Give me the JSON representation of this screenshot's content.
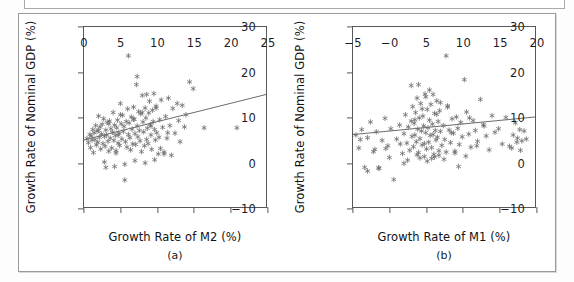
{
  "figure": {
    "panels": [
      {
        "id": "a",
        "caption": "(a)",
        "xlabel": "Growth Rate of M2 (%)",
        "ylabel": "Growth Rate of Nominal GDP (%)",
        "xticks": [
          "0",
          "5",
          "10",
          "15",
          "20",
          "25"
        ],
        "yticks": [
          "30",
          "20",
          "10",
          "0",
          "-10"
        ]
      },
      {
        "id": "b",
        "caption": "(b)",
        "xlabel": "Growth Rate of M1 (%)",
        "ylabel": "Growth Rate of Nominal GDP (%)",
        "xticks": [
          "-5",
          "-0",
          "5",
          "10",
          "15",
          "20"
        ],
        "yticks": [
          "30",
          "20",
          "10",
          "0",
          "-10"
        ]
      }
    ]
  },
  "style": {
    "marker_color": "#6e6e72",
    "line_color": "#5a5a5e",
    "axis_color": "#58585a",
    "frame_color": "#9a9a9c"
  },
  "chart_data": [
    {
      "type": "scatter",
      "id": "a",
      "title": "",
      "xlabel": "Growth Rate of M2 (%)",
      "ylabel": "Growth Rate of Nominal GDP (%)",
      "xlim": [
        0,
        25
      ],
      "ylim": [
        -10,
        30
      ],
      "xticks": [
        0,
        5,
        10,
        15,
        20,
        25
      ],
      "yticks": [
        -10,
        0,
        10,
        20,
        30
      ],
      "grid": false,
      "legend": "none",
      "marker": "asterisk",
      "trendline": {
        "x": [
          0,
          25
        ],
        "y": [
          4.9,
          15.0
        ]
      },
      "x": [
        0.4,
        0.6,
        0.8,
        0.9,
        1.0,
        1.1,
        1.2,
        1.3,
        1.4,
        1.5,
        1.6,
        1.7,
        1.8,
        1.9,
        2.0,
        2.1,
        2.2,
        2.3,
        2.4,
        2.5,
        2.6,
        2.7,
        2.8,
        2.9,
        3.0,
        3.1,
        3.2,
        3.3,
        3.4,
        3.5,
        3.6,
        3.7,
        3.8,
        3.9,
        4.0,
        4.1,
        4.2,
        4.3,
        4.4,
        4.5,
        4.6,
        4.7,
        4.8,
        4.9,
        5.0,
        5.1,
        5.2,
        5.3,
        5.4,
        5.5,
        5.6,
        5.7,
        5.8,
        5.9,
        6.0,
        6.1,
        6.2,
        6.3,
        6.4,
        6.5,
        6.6,
        6.7,
        6.8,
        6.9,
        7.0,
        7.1,
        7.2,
        7.3,
        7.4,
        7.5,
        7.6,
        7.7,
        7.8,
        7.9,
        8.0,
        8.1,
        8.2,
        8.3,
        8.4,
        8.5,
        8.6,
        8.7,
        8.8,
        8.9,
        9.0,
        9.1,
        9.2,
        9.3,
        9.4,
        9.5,
        9.6,
        9.7,
        9.8,
        9.9,
        10.0,
        10.2,
        10.4,
        10.5,
        10.6,
        10.8,
        11.0,
        11.2,
        11.4,
        11.6,
        11.8,
        12.0,
        12.2,
        12.5,
        12.8,
        13.0,
        13.2,
        13.5,
        13.8,
        14.0,
        14.5,
        15.0,
        16.5,
        21.0,
        6.1,
        7.3,
        8.6,
        9.9,
        5.0,
        2.0,
        3.4,
        4.7,
        6.8,
        8.0,
        9.2,
        10.3,
        11.5,
        2.8,
        4.2,
        5.6,
        7.0,
        8.4,
        9.7,
        11.0,
        3.0,
        4.4
      ],
      "y": [
        5.2,
        4.3,
        6.1,
        3.2,
        5.8,
        4.9,
        7.2,
        2.1,
        6.5,
        5.0,
        8.1,
        3.8,
        6.9,
        4.4,
        10.2,
        5.5,
        7.8,
        2.9,
        6.2,
        8.4,
        4.1,
        9.6,
        5.7,
        3.5,
        7.1,
        6.0,
        8.8,
        4.6,
        2.4,
        9.1,
        5.3,
        7.4,
        3.1,
        6.6,
        11.0,
        4.8,
        8.2,
        5.9,
        2.0,
        7.6,
        9.3,
        4.2,
        6.4,
        3.7,
        13.0,
        8.5,
        5.1,
        10.4,
        6.8,
        7.9,
        -4.0,
        4.5,
        9.0,
        3.3,
        11.8,
        6.1,
        8.7,
        5.4,
        2.7,
        10.0,
        7.3,
        4.0,
        12.2,
        9.5,
        6.3,
        3.9,
        17.2,
        8.0,
        5.6,
        11.2,
        7.0,
        4.7,
        10.7,
        2.3,
        14.8,
        8.9,
        6.7,
        3.6,
        12.0,
        9.8,
        5.0,
        7.5,
        4.1,
        10.9,
        13.5,
        8.3,
        6.0,
        2.8,
        11.5,
        9.0,
        15.2,
        7.2,
        4.9,
        12.4,
        6.5,
        1.8,
        9.4,
        3.0,
        13.8,
        7.7,
        2.2,
        10.1,
        5.3,
        14.2,
        8.1,
        1.5,
        11.9,
        6.4,
        13.0,
        9.2,
        4.5,
        12.6,
        7.8,
        10.5,
        17.8,
        16.3,
        7.6,
        7.6,
        23.6,
        19.0,
        15.0,
        12.0,
        10.5,
        7.0,
        8.5,
        6.0,
        9.5,
        11.0,
        8.0,
        5.5,
        6.5,
        0.0,
        -1.0,
        -0.5,
        0.3,
        -0.2,
        0.5,
        1.8,
        -1.2,
        2.5
      ]
    },
    {
      "type": "scatter",
      "id": "b",
      "title": "",
      "xlabel": "Growth Rate of M1 (%)",
      "ylabel": "Growth Rate of Nominal GDP (%)",
      "xlim": [
        -5,
        20
      ],
      "ylim": [
        -10,
        30
      ],
      "xticks": [
        -5,
        0,
        5,
        10,
        15,
        20
      ],
      "yticks": [
        -10,
        0,
        10,
        20,
        30
      ],
      "grid": false,
      "legend": "none",
      "marker": "asterisk",
      "trendline": {
        "x": [
          -5,
          20
        ],
        "y": [
          6.1,
          10.0
        ]
      },
      "x": [
        -4.6,
        -4.2,
        -3.8,
        -3.4,
        -3.0,
        -2.6,
        -2.2,
        -1.8,
        -1.4,
        -1.0,
        -0.6,
        -0.2,
        0.2,
        0.6,
        1.0,
        1.4,
        1.8,
        2.0,
        2.2,
        2.4,
        2.6,
        2.8,
        3.0,
        3.1,
        3.2,
        3.3,
        3.4,
        3.5,
        3.6,
        3.7,
        3.8,
        3.9,
        4.0,
        4.1,
        4.2,
        4.3,
        4.4,
        4.5,
        4.6,
        4.7,
        4.8,
        4.9,
        5.0,
        5.1,
        5.2,
        5.3,
        5.4,
        5.5,
        5.6,
        5.7,
        5.8,
        5.9,
        6.0,
        6.1,
        6.2,
        6.3,
        6.4,
        6.5,
        6.6,
        6.7,
        6.8,
        6.9,
        7.0,
        7.2,
        7.4,
        7.6,
        7.8,
        8.0,
        8.2,
        8.4,
        8.6,
        8.8,
        9.0,
        9.2,
        9.4,
        9.6,
        9.8,
        10.0,
        10.3,
        10.6,
        10.9,
        11.2,
        11.5,
        11.8,
        12.1,
        12.5,
        12.9,
        13.3,
        13.7,
        14.1,
        14.5,
        15.0,
        15.5,
        16.0,
        16.5,
        17.0,
        17.3,
        17.6,
        17.9,
        18.2,
        18.5,
        18.8,
        3.0,
        4.0,
        5.0,
        6.0,
        7.0,
        8.0,
        4.5,
        5.5,
        6.5,
        3.5,
        4.8,
        5.8,
        6.8,
        7.8,
        2.5,
        9.5,
        -3.0,
        -1.5,
        -0.5,
        -4.0,
        -2.0,
        0.0,
        1.5,
        2.0,
        8.5,
        11.0,
        13.0,
        16.8,
        17.5,
        18.0,
        5.2,
        6.2,
        7.5,
        9.0,
        10.5,
        12.0,
        4.2,
        3.8
      ],
      "y": [
        6.0,
        3.1,
        7.2,
        -1.2,
        5.4,
        8.9,
        2.3,
        6.7,
        -1.4,
        4.8,
        9.7,
        3.6,
        7.4,
        -3.9,
        5.1,
        8.2,
        1.9,
        6.3,
        10.5,
        4.2,
        7.8,
        2.6,
        9.1,
        5.7,
        12.3,
        3.4,
        8.6,
        6.0,
        11.0,
        4.5,
        14.2,
        7.3,
        2.1,
        9.8,
        5.2,
        13.0,
        6.9,
        3.8,
        10.2,
        8.0,
        4.1,
        15.1,
        6.5,
        2.9,
        11.7,
        7.6,
        4.4,
        9.3,
        5.9,
        12.8,
        3.2,
        8.4,
        6.1,
        1.7,
        10.8,
        7.0,
        4.9,
        13.6,
        5.5,
        9.0,
        2.5,
        11.4,
        6.8,
        3.7,
        8.1,
        5.0,
        23.6,
        12.2,
        7.1,
        4.3,
        9.6,
        6.4,
        2.0,
        10.0,
        7.5,
        3.9,
        8.8,
        5.6,
        18.3,
        11.1,
        6.2,
        3.3,
        9.2,
        7.0,
        4.6,
        13.9,
        8.3,
        5.8,
        2.7,
        10.3,
        6.6,
        7.4,
        4.0,
        9.9,
        3.5,
        6.0,
        8.7,
        5.3,
        7.2,
        4.7,
        6.9,
        5.1,
        17.0,
        17.2,
        14.5,
        15.0,
        13.2,
        12.5,
        11.8,
        16.0,
        10.6,
        9.4,
        1.2,
        0.8,
        1.5,
        2.2,
        0.4,
        -1.0,
        -2.0,
        -1.3,
        3.0,
        5.0,
        2.8,
        1.0,
        4.0,
        -0.3,
        6.5,
        9.8,
        8.0,
        3.1,
        4.4,
        2.6,
        0.2,
        1.1,
        0.6,
        2.4,
        1.3,
        3.6,
        0.9,
        1.6
      ]
    }
  ]
}
